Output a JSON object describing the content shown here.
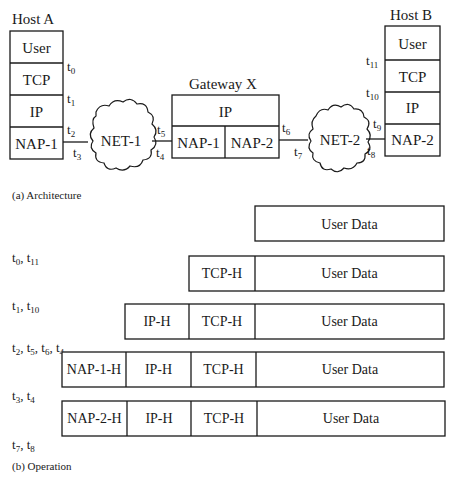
{
  "architecture": {
    "caption": "(a) Architecture",
    "host_a": {
      "title": "Host A",
      "layers": [
        "User",
        "TCP",
        "IP",
        "NAP-1"
      ],
      "time_labels": [
        "t0",
        "t1",
        "t2",
        "t3"
      ]
    },
    "net1": {
      "label": "NET-1",
      "time_labels": [
        "t3",
        "t4"
      ]
    },
    "gateway": {
      "title": "Gateway X",
      "top_layer": "IP",
      "left_layer": "NAP-1",
      "right_layer": "NAP-2",
      "time_labels": [
        "t5",
        "t4",
        "t6"
      ]
    },
    "net2": {
      "label": "NET-2",
      "time_labels": [
        "t7",
        "t8"
      ]
    },
    "host_b": {
      "title": "Host B",
      "layers": [
        "User",
        "TCP",
        "IP",
        "NAP-2"
      ],
      "time_labels": [
        "t11",
        "t10",
        "t9",
        "t8"
      ]
    }
  },
  "operation": {
    "caption": "(b) Operation",
    "rows": [
      {
        "segments": [
          "User Data"
        ],
        "time_label": "t0, t11"
      },
      {
        "segments": [
          "TCP-H",
          "User Data"
        ],
        "time_label": "t1, t10"
      },
      {
        "segments": [
          "IP-H",
          "TCP-H",
          "User Data"
        ],
        "time_label": "t2, t5, t6, t4"
      },
      {
        "segments": [
          "NAP-1-H",
          "IP-H",
          "TCP-H",
          "User Data"
        ],
        "time_label": "t3, t4"
      },
      {
        "segments": [
          "NAP-2-H",
          "IP-H",
          "TCP-H",
          "User Data"
        ],
        "time_label": "t7, t8"
      }
    ]
  },
  "colors": {
    "ink": "#1a1a1a",
    "background": "#ffffff"
  }
}
